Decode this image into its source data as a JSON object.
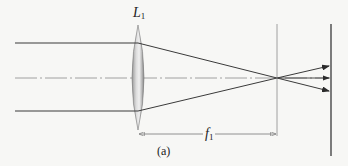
{
  "diagram": {
    "lens_label": "L",
    "lens_label_sub": "1",
    "focal_label": "f",
    "focal_label_sub": "1",
    "caption": "(a)"
  },
  "colors": {
    "ray": "#3a3a3a",
    "axis": "#888888",
    "lens_edge": "#777777",
    "background": "#f7f7f5"
  }
}
